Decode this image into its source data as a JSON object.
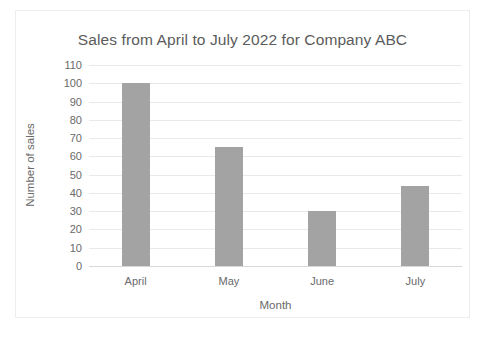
{
  "chart_data": {
    "type": "bar",
    "title": "Sales from April to July 2022 for Company ABC",
    "xlabel": "Month",
    "ylabel": "Number of sales",
    "categories": [
      "April",
      "May",
      "June",
      "July"
    ],
    "values": [
      100,
      65,
      30,
      44
    ],
    "series": [
      {
        "name": "Number of sales",
        "values": [
          100,
          65,
          30,
          44
        ]
      }
    ],
    "ylim": [
      0,
      110
    ],
    "ytick_labels": [
      "110",
      "100",
      "90",
      "80",
      "70",
      "60",
      "50",
      "40",
      "30",
      "20",
      "10",
      "0"
    ],
    "ytick_values": [
      110,
      100,
      90,
      80,
      70,
      60,
      50,
      40,
      30,
      20,
      10,
      0
    ],
    "ytick_step": 10,
    "grid": true,
    "legend": false,
    "legend_position": "none",
    "colors": {
      "bar": "#a3a3a3",
      "gridline": "#e9e9e9",
      "baseline": "#d8d8d8",
      "text": "#6a6a6a",
      "title_text": "#5b5b5b",
      "frame_border": "#ededed",
      "background": "#ffffff"
    }
  }
}
